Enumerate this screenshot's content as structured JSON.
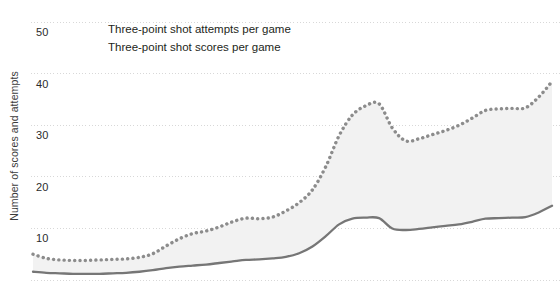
{
  "chart_data": {
    "type": "line",
    "title": "",
    "xlabel": "",
    "ylabel": "Number of scores and attempts",
    "ylim": [
      0,
      52
    ],
    "yticks": [
      10,
      20,
      30,
      40,
      50
    ],
    "ytick_labels": [
      "10",
      "20",
      "30",
      "40",
      "50"
    ],
    "grid": true,
    "grid_style": "dotted",
    "legend_position": "top-center",
    "xlim": [
      0,
      39
    ],
    "xticks": [],
    "xtick_labels": [],
    "series": [
      {
        "name": "Three-point shot attempts per game",
        "style": "dotted",
        "color": "#8c8c8c",
        "x": [
          0,
          1,
          2,
          3,
          4,
          5,
          6,
          7,
          8,
          9,
          10,
          11,
          12,
          13,
          14,
          15,
          16,
          17,
          18,
          19,
          20,
          21,
          22,
          23,
          24,
          25,
          26,
          27,
          28,
          29,
          30,
          31,
          32,
          33,
          34,
          35,
          36,
          37,
          38,
          39
        ],
        "values": [
          5.0,
          4.2,
          3.9,
          3.8,
          3.8,
          3.9,
          4.0,
          4.1,
          4.4,
          5.1,
          6.6,
          8.0,
          9.0,
          9.5,
          10.3,
          11.3,
          12.0,
          11.9,
          12.2,
          13.4,
          15.0,
          17.5,
          22.0,
          28.0,
          32.0,
          33.8,
          34.2,
          29.5,
          27.0,
          27.4,
          28.2,
          29.0,
          30.0,
          31.4,
          32.9,
          33.2,
          33.3,
          33.4,
          35.5,
          38.5
        ]
      },
      {
        "name": "Three-point shot scores per game",
        "style": "solid",
        "color": "#767676",
        "x": [
          0,
          1,
          2,
          3,
          4,
          5,
          6,
          7,
          8,
          9,
          10,
          11,
          12,
          13,
          14,
          15,
          16,
          17,
          18,
          19,
          20,
          21,
          22,
          23,
          24,
          25,
          26,
          27,
          28,
          29,
          30,
          31,
          32,
          33,
          34,
          35,
          36,
          37,
          38,
          39
        ],
        "values": [
          1.6,
          1.4,
          1.3,
          1.2,
          1.2,
          1.2,
          1.3,
          1.4,
          1.6,
          1.9,
          2.3,
          2.6,
          2.8,
          3.0,
          3.3,
          3.6,
          3.9,
          4.0,
          4.2,
          4.5,
          5.2,
          6.5,
          8.5,
          10.8,
          11.9,
          12.1,
          12.0,
          10.0,
          9.7,
          9.9,
          10.2,
          10.5,
          10.8,
          11.3,
          11.9,
          12.0,
          12.1,
          12.2,
          13.1,
          14.4
        ]
      }
    ],
    "band_fill_color": "#f2f2f2",
    "band_description": "Shaded area between attempts and scores series"
  },
  "legend": {
    "entries": [
      "Three-point shot attempts per game",
      "Three-point shot scores per game"
    ]
  },
  "axes": {
    "y_axis_title": "Number of scores and attempts",
    "y_tick_labels": [
      "50",
      "40",
      "30",
      "20",
      "10"
    ]
  },
  "colors": {
    "attempts_line": "#8c8c8c",
    "scores_line": "#767676",
    "band_fill": "#f2f2f2",
    "gridline": "#d8d8d8",
    "text": "#231f20",
    "background": "#ffffff"
  }
}
